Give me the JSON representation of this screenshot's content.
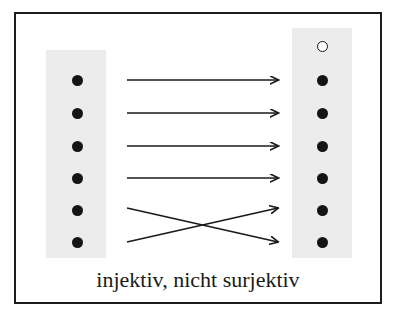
{
  "figure": {
    "caption": "injektiv, nicht surjektiv",
    "width": 397,
    "height": 323,
    "background_color": "#ffffff",
    "frame": {
      "border_color": "#1c1c1c",
      "border_width": 2,
      "x": 14,
      "y": 12,
      "width": 368,
      "height": 292
    }
  },
  "sets": {
    "domain": {
      "name": "left-set",
      "box_color": "#ececec",
      "x": 46,
      "y": 50,
      "width": 60,
      "height": 208,
      "elements": [
        {
          "id": "d1",
          "cx": 77,
          "cy": 80,
          "filled": true
        },
        {
          "id": "d2",
          "cx": 77,
          "cy": 113,
          "filled": true
        },
        {
          "id": "d3",
          "cx": 77,
          "cy": 146,
          "filled": true
        },
        {
          "id": "d4",
          "cx": 77,
          "cy": 178,
          "filled": true
        },
        {
          "id": "d5",
          "cx": 77,
          "cy": 210,
          "filled": true
        },
        {
          "id": "d6",
          "cx": 77,
          "cy": 242,
          "filled": true
        }
      ]
    },
    "codomain": {
      "name": "right-set",
      "box_color": "#ececec",
      "x": 292,
      "y": 28,
      "width": 60,
      "height": 230,
      "elements": [
        {
          "id": "c0",
          "cx": 322,
          "cy": 46,
          "filled": false
        },
        {
          "id": "c1",
          "cx": 322,
          "cy": 80,
          "filled": true
        },
        {
          "id": "c2",
          "cx": 322,
          "cy": 113,
          "filled": true
        },
        {
          "id": "c3",
          "cx": 322,
          "cy": 146,
          "filled": true
        },
        {
          "id": "c4",
          "cx": 322,
          "cy": 178,
          "filled": true
        },
        {
          "id": "c5",
          "cx": 322,
          "cy": 210,
          "filled": true
        },
        {
          "id": "c6",
          "cx": 322,
          "cy": 242,
          "filled": true
        }
      ]
    }
  },
  "mappings": {
    "line_color": "#1a1a1a",
    "arrows": [
      {
        "id": "a1",
        "from": "d1",
        "to": "c1",
        "x1": 127,
        "y1": 80,
        "x2": 278,
        "y2": 80
      },
      {
        "id": "a2",
        "from": "d2",
        "to": "c2",
        "x1": 127,
        "y1": 113,
        "x2": 278,
        "y2": 113
      },
      {
        "id": "a3",
        "from": "d3",
        "to": "c3",
        "x1": 127,
        "y1": 146,
        "x2": 278,
        "y2": 146
      },
      {
        "id": "a4",
        "from": "d4",
        "to": "c4",
        "x1": 127,
        "y1": 178,
        "x2": 278,
        "y2": 178
      },
      {
        "id": "a5",
        "from": "d5",
        "to": "c6",
        "x1": 127,
        "y1": 208,
        "x2": 278,
        "y2": 242
      },
      {
        "id": "a6",
        "from": "d6",
        "to": "c5",
        "x1": 127,
        "y1": 242,
        "x2": 278,
        "y2": 208
      }
    ]
  },
  "chart_data": {
    "type": "diagram",
    "title": "injektiv, nicht surjektiv",
    "domain_element_count": 6,
    "codomain_element_count": 7,
    "unmapped_codomain_elements": 1,
    "pairs": [
      [
        "d1",
        "c1"
      ],
      [
        "d2",
        "c2"
      ],
      [
        "d3",
        "c3"
      ],
      [
        "d4",
        "c4"
      ],
      [
        "d5",
        "c6"
      ],
      [
        "d6",
        "c5"
      ]
    ]
  }
}
